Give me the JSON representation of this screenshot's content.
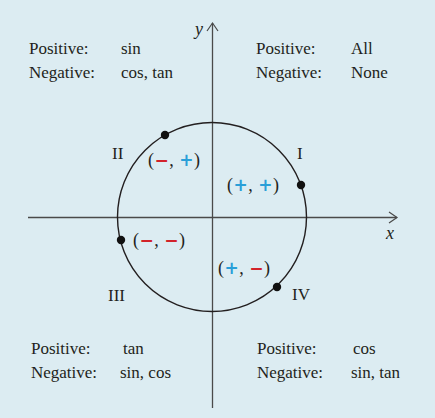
{
  "colors": {
    "background": "#dcecf2",
    "ink": "#231f20",
    "positive": "#2a9fd8",
    "negative": "#d2232a"
  },
  "axes": {
    "x_label": "x",
    "y_label": "y",
    "origin": [
      212,
      217
    ],
    "x_range_px": [
      28,
      398
    ],
    "y_range_px": [
      22,
      408
    ]
  },
  "circle": {
    "center": [
      212,
      217
    ],
    "radius": 95
  },
  "quadrants": [
    {
      "id": "I",
      "label": "I",
      "positive_key": "Positive:",
      "positive": "All",
      "negative_key": "Negative:",
      "negative": "None",
      "sign_x": "+",
      "sign_y": "+",
      "sign_x_color": "positive",
      "sign_y_color": "positive",
      "point": [
        301,
        185
      ]
    },
    {
      "id": "II",
      "label": "II",
      "positive_key": "Positive:",
      "positive": "sin",
      "negative_key": "Negative:",
      "negative": "cos, tan",
      "sign_x": "−",
      "sign_y": "+",
      "sign_x_color": "negative",
      "sign_y_color": "positive",
      "point": [
        165,
        135
      ]
    },
    {
      "id": "III",
      "label": "III",
      "positive_key": "Positive:",
      "positive": "tan",
      "negative_key": "Negative:",
      "negative": "sin, cos",
      "sign_x": "−",
      "sign_y": "−",
      "sign_x_color": "negative",
      "sign_y_color": "negative",
      "point": [
        121,
        240
      ]
    },
    {
      "id": "IV",
      "label": "IV",
      "positive_key": "Positive:",
      "positive": "cos",
      "negative_key": "Negative:",
      "negative": "sin, tan",
      "sign_x": "+",
      "sign_y": "−",
      "sign_x_color": "positive",
      "sign_y_color": "negative",
      "point": [
        277,
        287
      ]
    }
  ],
  "punct": {
    "open": "(",
    "comma": ", ",
    "close": ")"
  }
}
